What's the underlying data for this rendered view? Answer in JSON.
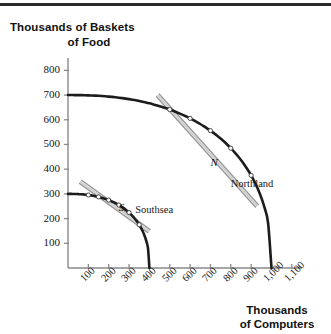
{
  "figure": {
    "top_rule": true
  },
  "axis_titles": {
    "y_line1": "Thousands of Baskets",
    "y_line2": "of Food",
    "x_line1": "Thousands",
    "x_line2": "of Computers"
  },
  "chart_data": {
    "type": "line",
    "title": "",
    "subtitle": "",
    "xlabel": "Thousands of Computers",
    "ylabel": "Thousands of Baskets of Food",
    "xlim": [
      0,
      1150
    ],
    "ylim": [
      0,
      850
    ],
    "grid": false,
    "legend_position": "inline-annotation",
    "x_ticks": [
      100,
      200,
      300,
      400,
      500,
      600,
      700,
      800,
      900,
      1000,
      1100
    ],
    "x_tick_labels": [
      "100",
      "200",
      "300",
      "400",
      "500",
      "600",
      "700",
      "800",
      "900",
      "1,000",
      "1,100"
    ],
    "y_ticks": [
      100,
      200,
      300,
      400,
      500,
      600,
      700,
      800
    ],
    "y_tick_labels": [
      "100",
      "200",
      "300",
      "400",
      "500",
      "600",
      "700",
      "800"
    ],
    "series": [
      {
        "name": "Northland",
        "label": "Northland",
        "color": "#1c1c1c",
        "y_intercept": 700,
        "x_intercept": 1000,
        "points": [
          {
            "x": 0,
            "y": 700
          },
          {
            "x": 100,
            "y": 698
          },
          {
            "x": 200,
            "y": 692
          },
          {
            "x": 300,
            "y": 680
          },
          {
            "x": 400,
            "y": 663
          },
          {
            "x": 500,
            "y": 640
          },
          {
            "x": 550,
            "y": 620
          },
          {
            "x": 600,
            "y": 600
          },
          {
            "x": 650,
            "y": 570
          },
          {
            "x": 700,
            "y": 420
          },
          {
            "x": 750,
            "y": 498
          },
          {
            "x": 800,
            "y": 420
          },
          {
            "x": 850,
            "y": 362
          },
          {
            "x": 900,
            "y": 305
          },
          {
            "x": 950,
            "y": 215
          },
          {
            "x": 1000,
            "y": 0
          }
        ],
        "markers": [
          {
            "x": 500,
            "y": 640
          },
          {
            "x": 600,
            "y": 600
          },
          {
            "x": 700,
            "y": 420
          },
          {
            "x": 800,
            "y": 420
          },
          {
            "x": 900,
            "y": 305
          }
        ]
      },
      {
        "name": "Southsea",
        "label": "Southsea",
        "color": "#1c1c1c",
        "y_intercept": 300,
        "x_intercept": 400,
        "points": [
          {
            "x": 0,
            "y": 300
          },
          {
            "x": 50,
            "y": 297
          },
          {
            "x": 100,
            "y": 290
          },
          {
            "x": 150,
            "y": 278
          },
          {
            "x": 200,
            "y": 262
          },
          {
            "x": 250,
            "y": 240
          },
          {
            "x": 300,
            "y": 205
          },
          {
            "x": 350,
            "y": 150
          },
          {
            "x": 400,
            "y": 0
          }
        ],
        "markers": [
          {
            "x": 100,
            "y": 290
          },
          {
            "x": 150,
            "y": 278
          },
          {
            "x": 200,
            "y": 262
          },
          {
            "x": 250,
            "y": 240
          },
          {
            "x": 300,
            "y": 205
          },
          {
            "x": 350,
            "y": 150
          }
        ]
      }
    ],
    "tangent_lines": [
      {
        "name": "northland-tangent",
        "at_point": "N",
        "color": "#9a9a9a",
        "x_from": 440,
        "y_from": 700,
        "x_to": 930,
        "y_to": 250
      },
      {
        "name": "southsea-tangent",
        "at_point": "S",
        "color": "#9a9a9a",
        "x_from": 60,
        "y_from": 350,
        "x_to": 400,
        "y_to": 148
      }
    ],
    "annotations": [
      {
        "name": "point-n",
        "text": "N",
        "x": 700,
        "y": 420,
        "style": "italic"
      },
      {
        "name": "point-s",
        "text": "S",
        "x": 250,
        "y": 240,
        "style": "italic"
      },
      {
        "name": "label-northland",
        "text": "Northland",
        "x": 800,
        "y": 330
      },
      {
        "name": "label-southsea",
        "text": "Southsea",
        "x": 330,
        "y": 228
      }
    ]
  },
  "colors": {
    "curve": "#1c1c1c",
    "tangent": "#9a9a9a",
    "axis": "#8a8a8a",
    "text": "#161616",
    "rule": "#2b2b2b"
  }
}
